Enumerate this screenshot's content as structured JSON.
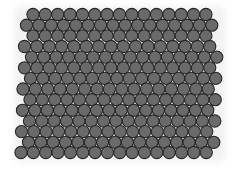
{
  "scene": {
    "description": "Hexagonally close-packed grey spheres viewed from above",
    "background": "#ffffff",
    "sphere_fill": "#6a6a6a",
    "sphere_stroke": "#262626",
    "radius": 6.1,
    "row_spacing": 10.65,
    "col_spacing": 12.35,
    "rows": [
      {
        "y": 14.5,
        "x0": 33.0,
        "count": 15
      },
      {
        "y": 25.2,
        "x0": 26.5,
        "count": 16
      },
      {
        "y": 35.8,
        "x0": 33.0,
        "count": 15
      },
      {
        "y": 46.5,
        "x0": 24.5,
        "count": 16
      },
      {
        "y": 57.1,
        "x0": 31.5,
        "count": 16
      },
      {
        "y": 67.8,
        "x0": 24.5,
        "count": 16
      },
      {
        "y": 78.4,
        "x0": 30.5,
        "count": 16
      },
      {
        "y": 89.0,
        "x0": 23.0,
        "count": 16
      },
      {
        "y": 99.7,
        "x0": 30.0,
        "count": 16
      },
      {
        "y": 110.3,
        "x0": 22.5,
        "count": 16
      },
      {
        "y": 121.0,
        "x0": 29.5,
        "count": 16
      },
      {
        "y": 131.6,
        "x0": 21.5,
        "count": 16
      },
      {
        "y": 142.3,
        "x0": 28.5,
        "count": 16
      },
      {
        "y": 152.5,
        "x0": 21.0,
        "count": 16
      }
    ]
  }
}
